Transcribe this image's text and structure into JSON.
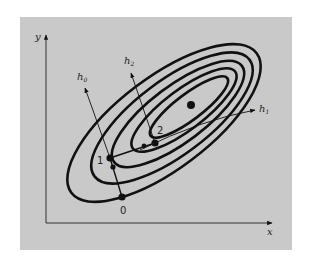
{
  "figure": {
    "panel_color": "#c9c9c9",
    "ink_color": "#111111",
    "axes": {
      "x_label": "x",
      "y_label": "y"
    },
    "minimum_dot": {
      "x": 191,
      "y": 105
    },
    "points": [
      {
        "label": "0",
        "x": 122,
        "y": 197
      },
      {
        "label": "1",
        "x": 110,
        "y": 158
      },
      {
        "label": "2",
        "x": 155,
        "y": 143
      }
    ],
    "directions": [
      {
        "label": "h",
        "subscript": "0"
      },
      {
        "label": "h",
        "subscript": "1"
      },
      {
        "label": "h",
        "subscript": "2"
      }
    ],
    "contour_count": 5
  }
}
